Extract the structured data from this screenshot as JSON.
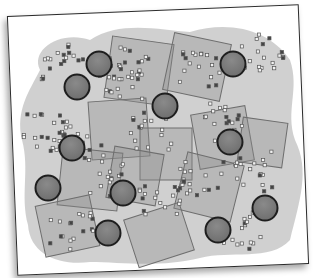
{
  "figure": {
    "colors": {
      "card_bg": "#ffffff",
      "card_border": "#2b2b2b",
      "blob": "#c8c8c8",
      "square_fill": "#8c8c8c",
      "square_stroke": "#6e6e6e",
      "circle_fill": "#6f6f6f",
      "circle_stroke": "#1e1e1e",
      "point_fill": "#f2f2f2",
      "point_stroke": "#555555",
      "point_dark": "#444444"
    },
    "circles": [
      {
        "x": 99,
        "y": 64
      },
      {
        "x": 77,
        "y": 87
      },
      {
        "x": 165,
        "y": 106
      },
      {
        "x": 233,
        "y": 64
      },
      {
        "x": 230,
        "y": 142
      },
      {
        "x": 72,
        "y": 148
      },
      {
        "x": 48,
        "y": 188
      },
      {
        "x": 123,
        "y": 193
      },
      {
        "x": 265,
        "y": 208
      },
      {
        "x": 108,
        "y": 233
      },
      {
        "x": 218,
        "y": 230
      }
    ],
    "squares": [
      {
        "x": 108,
        "y": 40,
        "w": 62,
        "h": 62,
        "r": 8
      },
      {
        "x": 168,
        "y": 38,
        "w": 58,
        "h": 58,
        "r": 12
      },
      {
        "x": 90,
        "y": 100,
        "w": 58,
        "h": 58,
        "r": -4
      },
      {
        "x": 140,
        "y": 128,
        "w": 52,
        "h": 52,
        "r": 0
      },
      {
        "x": 195,
        "y": 110,
        "w": 55,
        "h": 55,
        "r": -10
      },
      {
        "x": 60,
        "y": 150,
        "w": 60,
        "h": 58,
        "r": 6
      },
      {
        "x": 180,
        "y": 158,
        "w": 58,
        "h": 58,
        "r": 14
      },
      {
        "x": 40,
        "y": 200,
        "w": 55,
        "h": 52,
        "r": -12
      },
      {
        "x": 130,
        "y": 210,
        "w": 58,
        "h": 50,
        "r": -18
      },
      {
        "x": 240,
        "y": 120,
        "w": 45,
        "h": 45,
        "r": 8
      },
      {
        "x": 110,
        "y": 150,
        "w": 50,
        "h": 52,
        "r": 10
      }
    ]
  }
}
